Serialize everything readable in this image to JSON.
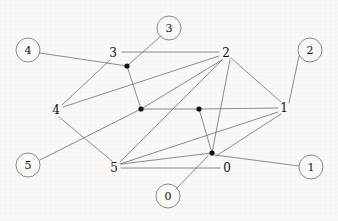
{
  "diagram": {
    "background_color": "#faf9f7",
    "edge_color": "#6e6e6e",
    "dot_color": "#101010",
    "label_color": "#101010",
    "width": 338,
    "height": 221
  },
  "circled_nodes": [
    {
      "id": "circ-4",
      "label": "4",
      "x": 28,
      "y": 50,
      "r": 12
    },
    {
      "id": "circ-3",
      "label": "3",
      "x": 169,
      "y": 28,
      "r": 12
    },
    {
      "id": "circ-2",
      "label": "2",
      "x": 310,
      "y": 50,
      "r": 12
    },
    {
      "id": "circ-5",
      "label": "5",
      "x": 28,
      "y": 165,
      "r": 12
    },
    {
      "id": "circ-0",
      "label": "0",
      "x": 168,
      "y": 196,
      "r": 12
    },
    {
      "id": "circ-1",
      "label": "1",
      "x": 311,
      "y": 167,
      "r": 12
    }
  ],
  "plain_nodes": [
    {
      "id": "lab-3",
      "label": "3",
      "x": 113,
      "y": 53
    },
    {
      "id": "lab-2",
      "label": "2",
      "x": 226,
      "y": 53
    },
    {
      "id": "lab-4",
      "label": "4",
      "x": 56,
      "y": 110
    },
    {
      "id": "lab-1",
      "label": "1",
      "x": 284,
      "y": 108
    },
    {
      "id": "lab-5",
      "label": "5",
      "x": 114,
      "y": 168
    },
    {
      "id": "lab-0",
      "label": "0",
      "x": 227,
      "y": 168
    }
  ],
  "vertex_dots": [
    {
      "id": "dot-a",
      "x": 127,
      "y": 66,
      "r": 2.6
    },
    {
      "id": "dot-b",
      "x": 141,
      "y": 109,
      "r": 2.6
    },
    {
      "id": "dot-c",
      "x": 199,
      "y": 109,
      "r": 2.6
    },
    {
      "id": "dot-d",
      "x": 212,
      "y": 153,
      "r": 2.6
    }
  ],
  "edges": [
    {
      "id": "e-lab3-lab2",
      "x1": 122,
      "y1": 52,
      "x2": 219,
      "y2": 52
    },
    {
      "id": "e-circ4-dota",
      "x1": 40,
      "y1": 53,
      "x2": 127,
      "y2": 66
    },
    {
      "id": "e-circ3-dota",
      "x1": 161,
      "y1": 36,
      "x2": 127,
      "y2": 66
    },
    {
      "id": "e-lab3-lab4",
      "x1": 110,
      "y1": 60,
      "x2": 62,
      "y2": 105
    },
    {
      "id": "e-dota-dotb",
      "x1": 127,
      "y1": 66,
      "x2": 141,
      "y2": 109
    },
    {
      "id": "e-lab2-lab4",
      "x1": 219,
      "y1": 56,
      "x2": 63,
      "y2": 107
    },
    {
      "id": "e-lab2-dotb",
      "x1": 222,
      "y1": 60,
      "x2": 141,
      "y2": 109
    },
    {
      "id": "e-lab2-lab5",
      "x1": 222,
      "y1": 60,
      "x2": 120,
      "y2": 162
    },
    {
      "id": "e-lab2-lab1",
      "x1": 231,
      "y1": 58,
      "x2": 281,
      "y2": 102
    },
    {
      "id": "e-lab2-dotd",
      "x1": 230,
      "y1": 60,
      "x2": 212,
      "y2": 153
    },
    {
      "id": "e-circ2-lab1",
      "x1": 299,
      "y1": 56,
      "x2": 289,
      "y2": 103
    },
    {
      "id": "e-dotb-dotc",
      "x1": 141,
      "y1": 109,
      "x2": 199,
      "y2": 109
    },
    {
      "id": "e-dotc-lab1",
      "x1": 199,
      "y1": 109,
      "x2": 278,
      "y2": 108
    },
    {
      "id": "e-dotc-dotd",
      "x1": 199,
      "y1": 109,
      "x2": 212,
      "y2": 153
    },
    {
      "id": "e-lab4-lab5",
      "x1": 59,
      "y1": 117,
      "x2": 112,
      "y2": 161
    },
    {
      "id": "e-circ5-dotb",
      "x1": 40,
      "y1": 160,
      "x2": 141,
      "y2": 109
    },
    {
      "id": "e-lab5-lab1",
      "x1": 120,
      "y1": 164,
      "x2": 278,
      "y2": 112
    },
    {
      "id": "e-lab5-lab0",
      "x1": 121,
      "y1": 168,
      "x2": 220,
      "y2": 168
    },
    {
      "id": "e-lab5-dotd",
      "x1": 121,
      "y1": 164,
      "x2": 212,
      "y2": 153
    },
    {
      "id": "e-circ0-dotd",
      "x1": 176,
      "y1": 189,
      "x2": 208,
      "y2": 156
    },
    {
      "id": "e-dotd-circ1",
      "x1": 215,
      "y1": 155,
      "x2": 299,
      "y2": 166
    },
    {
      "id": "e-lab1-dotd",
      "x1": 281,
      "y1": 114,
      "x2": 216,
      "y2": 156
    }
  ]
}
